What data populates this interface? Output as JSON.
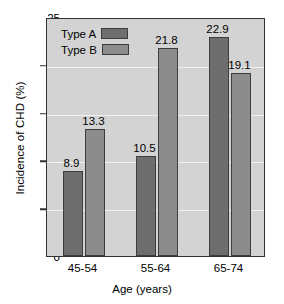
{
  "chart_data": {
    "type": "bar",
    "title": "",
    "xlabel": "Age (years)",
    "ylabel": "Incidence of CHD (%)",
    "categories": [
      "45-54",
      "55-64",
      "65-74"
    ],
    "series": [
      {
        "name": "Type A",
        "values": [
          8.9,
          10.5,
          22.9
        ],
        "color": "#6e6e6e"
      },
      {
        "name": "Type B",
        "values": [
          13.3,
          21.8,
          19.1
        ],
        "color": "#8c8c8c"
      }
    ],
    "ylim": [
      0,
      25
    ],
    "yticks": [
      0,
      5,
      10,
      15,
      20,
      25
    ],
    "ytick_labels": [
      "0",
      "5",
      "10",
      "15",
      "20",
      "25"
    ],
    "grid": true,
    "legend_position": "top-left-inside",
    "plot_background": "#d3d3d3",
    "axis_color": "#333333",
    "data_labels": [
      "8.9",
      "13.3",
      "10.5",
      "21.8",
      "22.9",
      "19.1"
    ]
  }
}
